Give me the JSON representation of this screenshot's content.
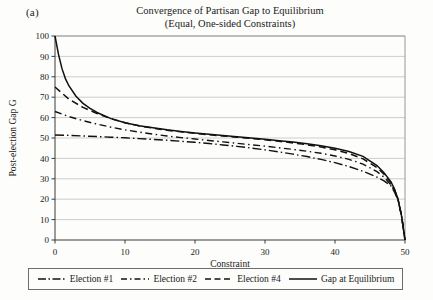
{
  "figure": {
    "panel_label": "(a)",
    "title_line1": "Convergence of Partisan Gap to Equilibrium",
    "title_line2": "(Equal, One-sided Constraints)"
  },
  "legend": {
    "items": [
      {
        "label": "Election #1",
        "style": "dash-dot",
        "color": "#111111"
      },
      {
        "label": "Election #2",
        "style": "dash-dot-short",
        "color": "#111111"
      },
      {
        "label": "Election #4",
        "style": "dashed",
        "color": "#111111"
      },
      {
        "label": "Gap at Equilibrium",
        "style": "solid",
        "color": "#111111"
      }
    ]
  },
  "chart_data": {
    "type": "line",
    "title": "Convergence of Partisan Gap to Equilibrium (Equal, One-sided Constraints)",
    "xlabel": "Constraint",
    "ylabel": "Post-election Gap G",
    "xlim": [
      0,
      50
    ],
    "ylim": [
      0,
      100
    ],
    "xticks": [
      0,
      10,
      20,
      30,
      40,
      50
    ],
    "yticks": [
      0,
      10,
      20,
      30,
      40,
      50,
      60,
      70,
      80,
      90,
      100
    ],
    "grid": "horizontal",
    "legend_position": "below-axes",
    "series": [
      {
        "name": "Gap at Equilibrium",
        "style": "solid",
        "x": [
          0,
          0.5,
          1,
          1.5,
          2,
          3,
          4,
          5,
          6,
          8,
          10,
          12,
          14,
          16,
          18,
          20,
          22,
          24,
          26,
          28,
          30,
          32,
          34,
          36,
          38,
          40,
          42,
          44,
          46,
          47,
          48,
          48.5,
          49,
          49.5,
          50
        ],
        "y": [
          100,
          91,
          84,
          79,
          75.5,
          70.5,
          67,
          64.5,
          62.5,
          59.5,
          57.5,
          56,
          55,
          54,
          53.2,
          52.5,
          51.8,
          51.2,
          50.6,
          50,
          49.4,
          48.7,
          48,
          47.2,
          46.2,
          45,
          43.4,
          41,
          36.5,
          33,
          28.5,
          25,
          20,
          12,
          0
        ]
      },
      {
        "name": "Election #4",
        "style": "dashed",
        "x": [
          0,
          2,
          4,
          6,
          8,
          10,
          12,
          14,
          16,
          18,
          20,
          22,
          24,
          26,
          28,
          30,
          32,
          34,
          36,
          38,
          40,
          42,
          44,
          46,
          47,
          48,
          48.5,
          49,
          49.5,
          50
        ],
        "y": [
          75,
          69,
          65,
          62,
          59.5,
          57.5,
          56,
          54.8,
          53.8,
          53,
          52.3,
          51.6,
          51,
          50.4,
          49.8,
          49.1,
          48.4,
          47.6,
          46.7,
          45.6,
          44.2,
          42.4,
          39.8,
          35.5,
          32.2,
          28,
          24.6,
          20,
          12,
          0
        ]
      },
      {
        "name": "Election #2",
        "style": "dash-dot-short",
        "x": [
          0,
          2,
          4,
          6,
          8,
          10,
          12,
          14,
          16,
          18,
          20,
          22,
          24,
          26,
          28,
          30,
          32,
          34,
          36,
          38,
          40,
          42,
          44,
          46,
          47,
          48,
          48.5,
          49,
          49.5,
          50
        ],
        "y": [
          63,
          60.5,
          58.5,
          56.8,
          55.3,
          54,
          52.9,
          51.9,
          51,
          50.2,
          49.5,
          48.8,
          48.1,
          47.4,
          46.7,
          46,
          45.2,
          44.4,
          43.5,
          42.5,
          41.2,
          39.5,
          37.2,
          33.5,
          30.8,
          27,
          24,
          20,
          12,
          0
        ]
      },
      {
        "name": "Election #1",
        "style": "dash-dot",
        "x": [
          0,
          2,
          4,
          6,
          8,
          10,
          12,
          14,
          16,
          18,
          20,
          22,
          24,
          26,
          28,
          30,
          32,
          34,
          36,
          38,
          40,
          42,
          44,
          46,
          47,
          48,
          48.5,
          49,
          49.5,
          50
        ],
        "y": [
          51.5,
          51.3,
          51,
          50.7,
          50.4,
          50.1,
          49.7,
          49.3,
          48.9,
          48.4,
          47.9,
          47.3,
          46.6,
          45.9,
          45.1,
          44.2,
          43.2,
          42.1,
          40.9,
          39.5,
          37.9,
          36,
          33.7,
          30.8,
          29,
          26.5,
          23.5,
          19.5,
          12,
          0
        ]
      }
    ]
  }
}
